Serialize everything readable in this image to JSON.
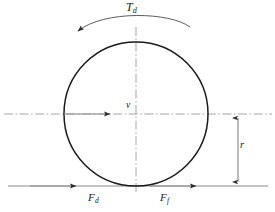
{
  "figure": {
    "type": "free-body-diagram",
    "background_color": "#ffffff",
    "stroke_color": "#1a1a1a",
    "line_color": "#7a7a7a",
    "centerline_color": "#8a8a8a"
  },
  "labels": {
    "torque": {
      "symbol": "T",
      "subscript": "d",
      "text": "Td"
    },
    "velocity": {
      "symbol": "v",
      "subscript": "",
      "text": "v"
    },
    "radius": {
      "symbol": "r",
      "subscript": "",
      "text": "r"
    },
    "force_drive": {
      "symbol": "F",
      "subscript": "d",
      "text": "Fd"
    },
    "force_friction": {
      "symbol": "F",
      "subscript": "f",
      "text": "Ff"
    }
  },
  "geometry": {
    "wheel": {
      "center_x": 136,
      "center_y": 114,
      "radius": 72
    },
    "horizontal_centerline": {
      "y": 114,
      "x_start": 4,
      "x_end": 272
    },
    "vertical_centerline": {
      "x": 136,
      "y_start": 27,
      "y_end": 192
    },
    "ground_line": {
      "y": 186,
      "x_start": 8,
      "x_end": 268
    },
    "velocity_arrow": {
      "y": 114,
      "x_start": 64,
      "x_end": 112,
      "direction": "right"
    },
    "torque_arc": {
      "x_start": 76,
      "x_end": 190,
      "peak_y": 14,
      "direction": "counterclockwise"
    },
    "radius_dimension": {
      "x": 238,
      "y_top": 114,
      "y_bottom": 186
    },
    "force_drive_arrow": {
      "y": 186,
      "x_tip": 76,
      "direction": "right"
    },
    "force_friction_arrow": {
      "y": 186,
      "x_tip": 196,
      "direction": "right"
    }
  }
}
